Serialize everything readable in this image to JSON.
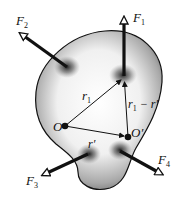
{
  "diagram": {
    "body": {
      "fill_color": "#8a8a8a",
      "highlight_color": "#f4f4f4",
      "outline_color": "#111111"
    },
    "forces": [
      {
        "id": "F1",
        "symbol": "F",
        "subscript": "1",
        "application_point": [
          124,
          76
        ],
        "tip": [
          124,
          14
        ]
      },
      {
        "id": "F2",
        "symbol": "F",
        "subscript": "2",
        "application_point": [
          67,
          67
        ],
        "tip": [
          18,
          32
        ]
      },
      {
        "id": "F3",
        "symbol": "F",
        "subscript": "3",
        "application_point": [
          88,
          154
        ],
        "tip": [
          40,
          176
        ]
      },
      {
        "id": "F4",
        "symbol": "F",
        "subscript": "4",
        "application_point": [
          120,
          151
        ],
        "tip": [
          165,
          176
        ]
      }
    ],
    "points": [
      {
        "id": "O",
        "label": "O",
        "position": [
          65,
          126
        ]
      },
      {
        "id": "O_prime",
        "label": "O′",
        "position": [
          128,
          137
        ]
      }
    ],
    "vectors": [
      {
        "id": "r1",
        "symbol": "r",
        "subscript": "1",
        "from": "O",
        "to": "F1"
      },
      {
        "id": "r_prime",
        "symbol": "r′",
        "subscript": "",
        "from": "O",
        "to": "O_prime"
      },
      {
        "id": "r1_minus_r_prime",
        "symbol": "r",
        "subscript": "1",
        "suffix": " − r′",
        "from": "O_prime",
        "to": "F1"
      }
    ]
  }
}
